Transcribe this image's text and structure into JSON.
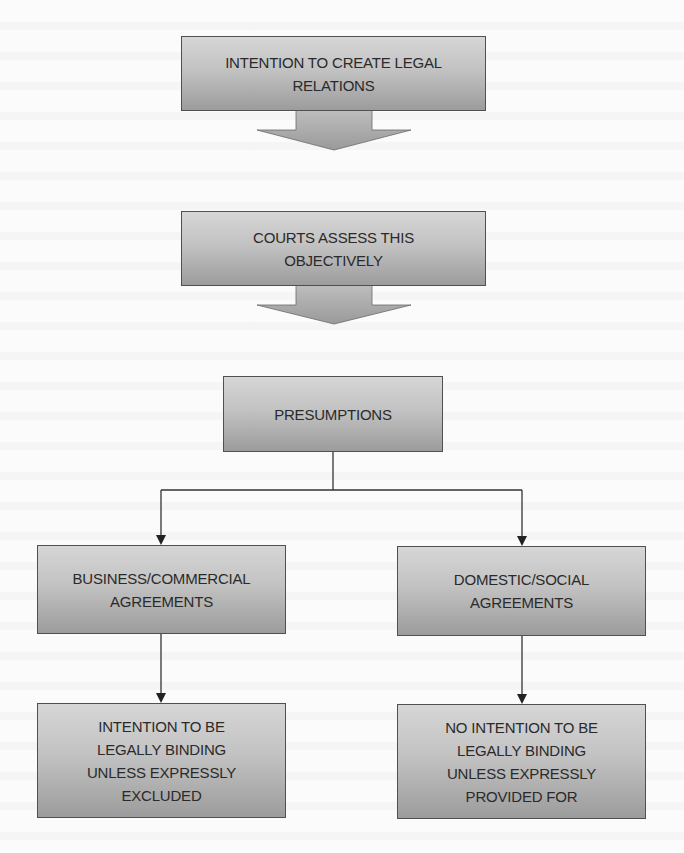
{
  "diagram": {
    "type": "flowchart",
    "colors": {
      "box_fill_top": "#d6d6d6",
      "box_fill_bottom": "#9c9c9c",
      "box_border": "#505050",
      "text": "#2a2a2a",
      "connector": "#333333",
      "block_arrow_fill": "#a8a8a8",
      "background": "#fbfbfb"
    },
    "nodes": {
      "intention": {
        "label": "INTENTION TO CREATE LEGAL\nRELATIONS"
      },
      "courts": {
        "label": "COURTS ASSESS THIS\nOBJECTIVELY"
      },
      "presumptions": {
        "label": "PRESUMPTIONS"
      },
      "business": {
        "label": "BUSINESS/COMMERCIAL\nAGREEMENTS"
      },
      "domestic": {
        "label": "DOMESTIC/SOCIAL\nAGREEMENTS"
      },
      "business_outcome": {
        "label": "INTENTION TO BE\nLEGALLY BINDING\nUNLESS EXPRESSLY\nEXCLUDED"
      },
      "domestic_outcome": {
        "label": "NO INTENTION TO BE\nLEGALLY BINDING\nUNLESS EXPRESSLY\nPROVIDED FOR"
      }
    },
    "edges": [
      {
        "from": "intention",
        "to": "courts",
        "style": "block-arrow"
      },
      {
        "from": "courts",
        "to": "presumptions",
        "style": "block-arrow"
      },
      {
        "from": "presumptions",
        "to": "business",
        "style": "elbow-arrow"
      },
      {
        "from": "presumptions",
        "to": "domestic",
        "style": "elbow-arrow"
      },
      {
        "from": "business",
        "to": "business_outcome",
        "style": "line-arrow"
      },
      {
        "from": "domestic",
        "to": "domestic_outcome",
        "style": "line-arrow"
      }
    ]
  }
}
